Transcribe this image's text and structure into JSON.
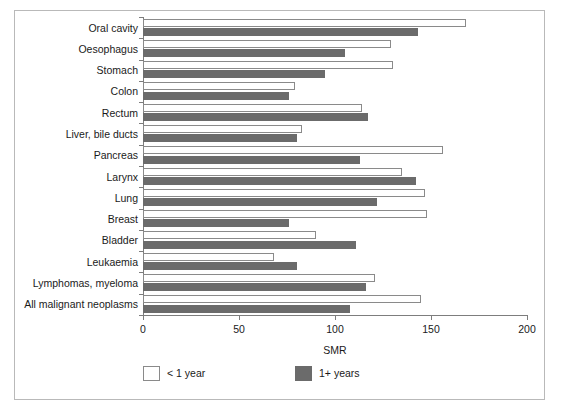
{
  "chart_data": {
    "type": "bar",
    "orientation": "horizontal",
    "title": "",
    "xlabel": "SMR",
    "ylabel": "",
    "xlim": [
      0,
      200
    ],
    "xticks": [
      0,
      50,
      100,
      150,
      200
    ],
    "xtick_labels": [
      "0",
      "50",
      "100",
      "150",
      "200"
    ],
    "grid": false,
    "legend_position": "bottom-left",
    "categories": [
      "Oral cavity",
      "Oesophagus",
      "Stomach",
      "Colon",
      "Rectum",
      "Liver, bile ducts",
      "Pancreas",
      "Larynx",
      "Lung",
      "Breast",
      "Bladder",
      "Leukaemia",
      "Lymphomas, myeloma",
      "All malignant neoplasms"
    ],
    "series": [
      {
        "name": "< 1 year",
        "color": "#ffffff",
        "edgecolor": "#8a8a8a",
        "values": [
          168,
          129,
          130,
          79,
          114,
          83,
          156,
          135,
          147,
          148,
          90,
          68,
          121,
          145
        ]
      },
      {
        "name": "1+ years",
        "color": "#6b6b6b",
        "edgecolor": "#6b6b6b",
        "values": [
          143,
          105,
          95,
          76,
          117,
          80,
          113,
          142,
          122,
          76,
          111,
          80,
          116,
          108
        ]
      }
    ]
  },
  "legend": {
    "entries": [
      {
        "label": "< 1 year",
        "swatch": "white"
      },
      {
        "label": "1+ years",
        "swatch": "grey"
      }
    ]
  },
  "axis": {
    "x_title": "SMR"
  }
}
